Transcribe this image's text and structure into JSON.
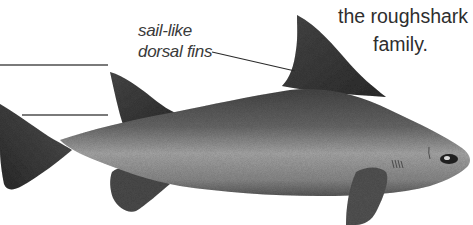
{
  "illustration": {
    "subject": "roughshark",
    "style": "grayscale pencil illustration",
    "colors": {
      "background": "#ffffff",
      "body_dark": "#3c3c3c",
      "body_mid": "#6e6e6e",
      "belly_light": "#a8a8a8",
      "rule_lines": "#7a7a7a",
      "text": "#2e2e2e"
    }
  },
  "labels": {
    "dorsal_fins": {
      "line1": "sail-like",
      "line2": "dorsal fins"
    },
    "caption": {
      "line1": "the roughshark",
      "line2": "family."
    }
  },
  "decorations": {
    "rule_lines": 2,
    "leader_lines": 1
  }
}
